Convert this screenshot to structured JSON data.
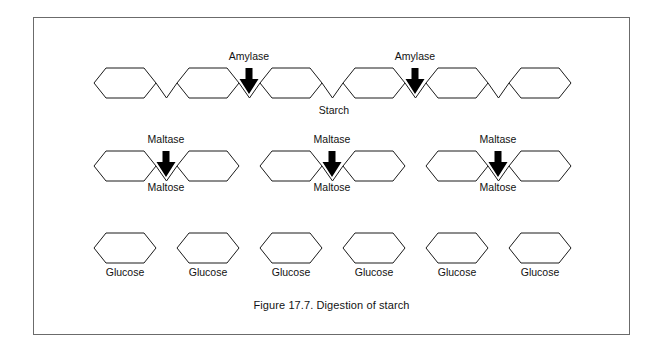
{
  "figure": {
    "caption": "Figure 17.7. Digestion of starch",
    "border_color": "#6b6b6b",
    "background_color": "#ffffff",
    "line_color": "#1a1a1a",
    "arrow_color": "#000000"
  },
  "rows": [
    {
      "id": "starch-row",
      "name": "starch-chain",
      "molecule_label": "Starch",
      "molecule_label_x": 334,
      "molecule_label_y": 114,
      "units": 6,
      "hexagons": [
        {
          "cx": 125,
          "cy": 83
        },
        {
          "cx": 208,
          "cy": 83
        },
        {
          "cx": 291,
          "cy": 83
        },
        {
          "cx": 374,
          "cy": 83
        },
        {
          "cx": 457,
          "cy": 83
        },
        {
          "cx": 540,
          "cy": 83
        }
      ],
      "enzymes": [
        {
          "label": "Amylase",
          "x": 249,
          "label_y": 60,
          "arrow_y": 68
        },
        {
          "label": "Amylase",
          "x": 415,
          "label_y": 60,
          "arrow_y": 68
        }
      ]
    },
    {
      "id": "maltose-row",
      "name": "maltose-groups",
      "groups": [
        {
          "molecule_label": "Maltose",
          "enzyme_label": "Maltase",
          "hexagons": [
            {
              "cx": 125,
              "cy": 166
            },
            {
              "cx": 208,
              "cy": 166
            }
          ],
          "center_x": 166,
          "enzyme_label_y": 143,
          "arrow_y": 151,
          "molecule_label_y": 191
        },
        {
          "molecule_label": "Maltose",
          "enzyme_label": "Maltase",
          "hexagons": [
            {
              "cx": 291,
              "cy": 166
            },
            {
              "cx": 374,
              "cy": 166
            }
          ],
          "center_x": 332,
          "enzyme_label_y": 143,
          "arrow_y": 151,
          "molecule_label_y": 191
        },
        {
          "molecule_label": "Maltose",
          "enzyme_label": "Maltase",
          "hexagons": [
            {
              "cx": 457,
              "cy": 166
            },
            {
              "cx": 540,
              "cy": 166
            }
          ],
          "center_x": 498,
          "enzyme_label_y": 143,
          "arrow_y": 151,
          "molecule_label_y": 191
        }
      ]
    },
    {
      "id": "glucose-row",
      "name": "glucose-units",
      "label_y": 276,
      "hexagons": [
        {
          "cx": 125,
          "cy": 248,
          "label": "Glucose"
        },
        {
          "cx": 208,
          "cy": 248,
          "label": "Glucose"
        },
        {
          "cx": 291,
          "cy": 248,
          "label": "Glucose"
        },
        {
          "cx": 374,
          "cy": 248,
          "label": "Glucose"
        },
        {
          "cx": 457,
          "cy": 248,
          "label": "Glucose"
        },
        {
          "cx": 540,
          "cy": 248,
          "label": "Glucose"
        }
      ]
    }
  ],
  "geometry": {
    "hex_half_width": 31,
    "hex_half_height": 15,
    "hex_flat_inset": 12
  }
}
